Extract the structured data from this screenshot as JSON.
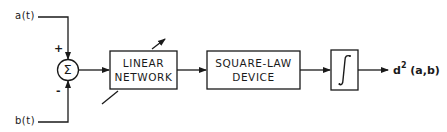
{
  "diagram": {
    "inputs": {
      "a": "a(t)",
      "b": "b(t)"
    },
    "summer": {
      "symbol": "Σ",
      "plus_sign": "+",
      "minus_sign": "-"
    },
    "blocks": [
      {
        "line1": "LINEAR",
        "line2": "NETWORK",
        "adjustable": true
      },
      {
        "line1": "SQUARE-LAW",
        "line2": "DEVICE"
      },
      {
        "symbol": "∫"
      }
    ],
    "output": {
      "base": "d",
      "exponent": "2",
      "args": "(a,b)"
    },
    "colors": {
      "stroke": "#1a1a1a",
      "background": "#ffffff"
    }
  }
}
